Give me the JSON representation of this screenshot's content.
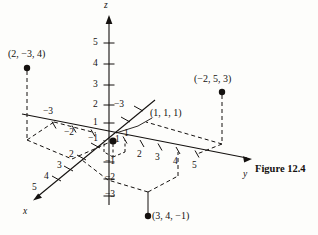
{
  "figure": {
    "caption": "Figure 12.4",
    "axes": [
      {
        "name": "x-axis",
        "label": "x"
      },
      {
        "name": "y-axis",
        "label": "y"
      },
      {
        "name": "z-axis",
        "label": "z"
      }
    ],
    "axis_tick_labels": {
      "z_positive": [
        "1",
        "2",
        "3",
        "4",
        "5"
      ],
      "z_negative": [
        "−1",
        "−2",
        "−3"
      ],
      "y_positive": [
        "1",
        "2",
        "3",
        "4",
        "5"
      ],
      "y_negative": [
        "−1",
        "−2",
        "−3"
      ],
      "x_positive": [
        "1",
        "2",
        "3",
        "4",
        "5"
      ]
    },
    "ticks": {
      "z5": "5",
      "z4": "4",
      "z3": "3",
      "z2": "2",
      "z1": "1",
      "zm1": "−1",
      "zm2": "−2",
      "zm3": "−3",
      "y1": "1",
      "y2": "2",
      "y3": "3",
      "y4": "4",
      "y5": "5",
      "ym1": "−1",
      "ym2": "−2",
      "ym3": "−3",
      "x1": "1",
      "x2": "2",
      "x3": "3",
      "x4": "4",
      "x5": "5"
    },
    "points": [
      {
        "name": "point-2-neg3-4",
        "label": "(2, −3, 4)",
        "coords": [
          2,
          -3,
          4
        ]
      },
      {
        "name": "point-neg2-5-3",
        "label": "(−2, 5, 3)",
        "coords": [
          -2,
          5,
          3
        ]
      },
      {
        "name": "point-1-1-1",
        "label": "(1, 1, 1)",
        "coords": [
          1,
          1,
          1
        ]
      },
      {
        "name": "point-3-4-neg1",
        "label": "(3, 4, −1)",
        "coords": [
          3,
          4,
          -1
        ]
      }
    ],
    "colors": {
      "ink": "#14110f",
      "paper": "#fdfdfb"
    }
  }
}
